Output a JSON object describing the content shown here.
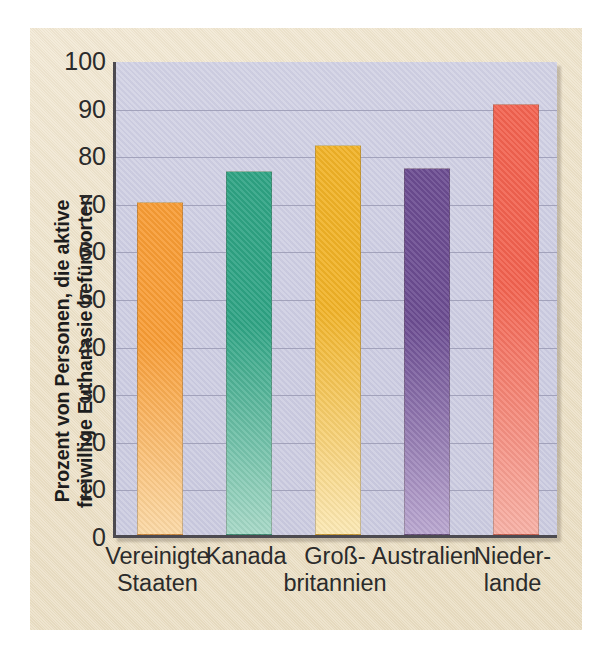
{
  "chart_data": {
    "type": "bar",
    "title": "",
    "xlabel": "",
    "ylabel": "Prozent von Personen, die aktive freiwillige Euthanasie befürworten",
    "ylabel_line1": "Prozent von Personen, die aktive",
    "ylabel_line2": "freiwillige Euthanasie befürworten",
    "ylim": [
      0,
      100
    ],
    "ytick_labels": [
      "100",
      "90",
      "80",
      "70",
      "60",
      "50",
      "40",
      "30",
      "20",
      "10",
      "0"
    ],
    "ytick_values": [
      100,
      90,
      80,
      70,
      60,
      50,
      40,
      30,
      20,
      10,
      0
    ],
    "grid": true,
    "legend": "none",
    "categories": [
      "Vereinigte Staaten",
      "Kanada",
      "Großbritannien",
      "Australien",
      "Niederlande"
    ],
    "category_lines": [
      [
        "Vereinigte",
        "Staaten"
      ],
      [
        "Kanada",
        ""
      ],
      [
        "Groß-",
        "britannien"
      ],
      [
        "Australien",
        ""
      ],
      [
        "Nieder-",
        "lande"
      ]
    ],
    "values": [
      70,
      76.5,
      82,
      77,
      90.5
    ],
    "bar_colors": [
      "#f79c35",
      "#2ea383",
      "#f0b227",
      "#6b4c91",
      "#f2624f"
    ],
    "bar_colors_bottom": [
      "#fbd9a6",
      "#a6d8c6",
      "#fbe8b4",
      "#b9a6cf",
      "#f7b0a5"
    ],
    "plot_background": "#ccccdf",
    "paper_background": "#ece0c6",
    "axis_color": "#4c4a50",
    "gridline_color": "#9a9ab4"
  }
}
